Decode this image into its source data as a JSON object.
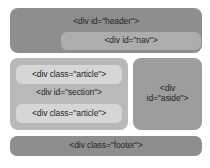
{
  "diagram": {
    "background_color": "#ffffff",
    "header": {
      "label": "<div id=\"header\">",
      "color": "#8e8e8e",
      "nav": {
        "label": "<div id=\"nav\">",
        "color": "#adadad"
      }
    },
    "section": {
      "label": "<div id=\"section\">",
      "color": "#b9b9b9",
      "articles": [
        {
          "label": "<div class=\"article\">",
          "color": "#d6d6d6"
        },
        {
          "label": "<div class=\"article\">",
          "color": "#d6d6d6"
        }
      ]
    },
    "aside": {
      "label_line_1": "<div",
      "label_line_2": "id=\"aside\">",
      "color": "#9d9d9d"
    },
    "footer": {
      "label": "<div class=\"footer\">",
      "color": "#8e8e8e"
    }
  }
}
